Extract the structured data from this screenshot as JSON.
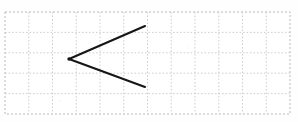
{
  "image": {
    "kind": "geometry-worksheet-figure",
    "width": 298,
    "height": 122,
    "background_color": "#ffffff",
    "description": "Hand-drawn angle shaped like a less-than sign on dotted graph paper",
    "text_labels": []
  },
  "grid": {
    "name": "dotted-graph-paper",
    "origin_x": 5,
    "origin_y": 12,
    "width": 285,
    "height": 102,
    "cell_width": 23.75,
    "cell_height": 20.4,
    "columns": 12,
    "rows": 5,
    "line_color": "#c9c9c9",
    "border_color": "#b9b9b9",
    "line_style": "dashed"
  },
  "figure": {
    "name": "angle-less-than",
    "stroke_color": "#161616",
    "stroke_width": 2.1,
    "vertex": {
      "x": 69,
      "y": 59
    },
    "rays": [
      {
        "name": "upper-ray",
        "from": {
          "x": 69,
          "y": 59
        },
        "to": {
          "x": 145,
          "y": 26
        }
      },
      {
        "name": "lower-ray",
        "from": {
          "x": 69,
          "y": 59
        },
        "to": {
          "x": 145,
          "y": 87
        }
      }
    ]
  },
  "specks": [
    {
      "x": 30,
      "y": 22,
      "r": 0.7
    },
    {
      "x": 96,
      "y": 35,
      "r": 0.6
    },
    {
      "x": 188,
      "y": 48,
      "r": 0.7
    },
    {
      "x": 225,
      "y": 95,
      "r": 0.6
    },
    {
      "x": 60,
      "y": 101,
      "r": 0.7
    },
    {
      "x": 262,
      "y": 30,
      "r": 0.6
    },
    {
      "x": 150,
      "y": 108,
      "r": 0.6
    },
    {
      "x": 16,
      "y": 72,
      "r": 0.6
    }
  ]
}
